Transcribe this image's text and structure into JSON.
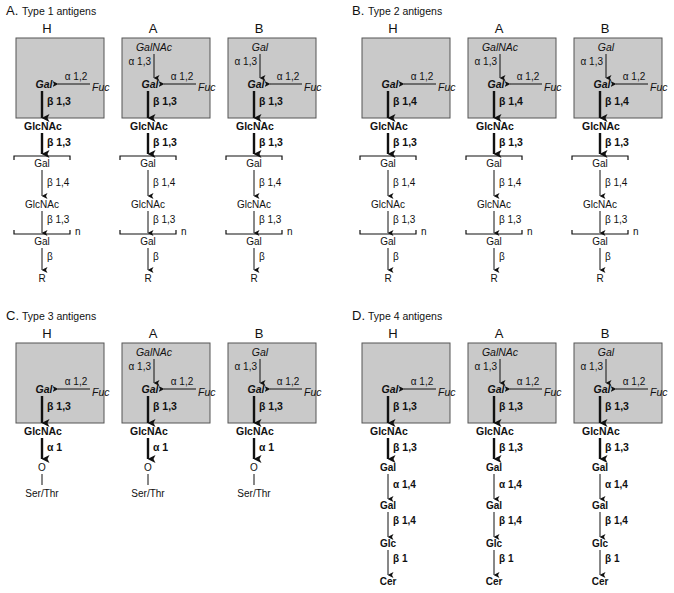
{
  "figure": {
    "panels": [
      {
        "id": "A",
        "title": "A. Type 1 antigens",
        "x": 6,
        "y": 13,
        "chain": "type12",
        "core_link": "β 1,3",
        "second_link": "β 1,3",
        "columns": [
          "H",
          "A",
          "B"
        ]
      },
      {
        "id": "B",
        "title": "B. Type 2 antigens",
        "x": 352,
        "y": 13,
        "chain": "type12",
        "core_link": "β 1,4",
        "second_link": "β 1,3",
        "columns": [
          "H",
          "A",
          "B"
        ]
      },
      {
        "id": "C",
        "title": "C. Type 3 antigens",
        "x": 6,
        "y": 318,
        "chain": "type3",
        "core_link": "β 1,3",
        "second_link": "α 1",
        "columns": [
          "H",
          "A",
          "B"
        ]
      },
      {
        "id": "D",
        "title": "D. Type 4 antigens",
        "x": 352,
        "y": 318,
        "chain": "type4",
        "core_link": "β 1,3",
        "second_link": "β 1,3",
        "columns": [
          "H",
          "A",
          "B"
        ]
      }
    ],
    "box": {
      "terminal_sugar": {
        "H": "",
        "A": "GalNAc",
        "B": "Gal"
      },
      "terminal_link": "α 1,3",
      "gal": "Gal",
      "fuc": "Fuc",
      "fuc_link": "α 1,2",
      "glcnac": "GlcNAc"
    },
    "type12_repeat": {
      "gal": "Gal",
      "link1": "β 1,4",
      "glcnac": "GlcNAc",
      "link2": "β 1,3",
      "repeat_label": "n",
      "gal2": "Gal",
      "link3": "β",
      "r": "R"
    },
    "type3_tail": {
      "o": "O",
      "ser_thr": "Ser/Thr"
    },
    "type4_tail": {
      "gal1": "Gal",
      "link1": "α 1,4",
      "gal2": "Gal",
      "link2": "β 1,4",
      "glc": "Glc",
      "link3": "β 1",
      "cer": "Cer"
    },
    "colors": {
      "box_fill": "#c9c9c9",
      "box_stroke": "#555555",
      "ink": "#111111"
    }
  }
}
